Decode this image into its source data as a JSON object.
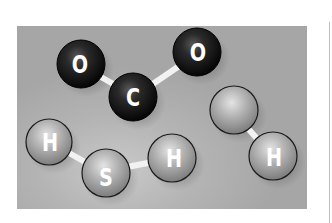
{
  "illustration": {
    "title": "Molecules illustration",
    "panel_color": "#a9a9a9",
    "molecules": [
      {
        "name": "carbon-dioxide",
        "atoms": [
          {
            "label": "O",
            "cx": 81,
            "cy": 64,
            "r": 24,
            "style": "dark"
          },
          {
            "label": "C",
            "cx": 133,
            "cy": 97,
            "r": 24,
            "style": "dark"
          },
          {
            "label": "O",
            "cx": 197,
            "cy": 52,
            "r": 24,
            "style": "dark"
          }
        ],
        "bonds": [
          [
            0,
            1
          ],
          [
            1,
            2
          ]
        ]
      },
      {
        "name": "hydrogen-sulfide",
        "atoms": [
          {
            "label": "H",
            "cx": 49,
            "cy": 142,
            "r": 23,
            "style": "light"
          },
          {
            "label": "S",
            "cx": 106,
            "cy": 173,
            "r": 24,
            "style": "light"
          },
          {
            "label": "H",
            "cx": 172,
            "cy": 158,
            "r": 24,
            "style": "light"
          }
        ],
        "bonds": [
          [
            0,
            1
          ],
          [
            1,
            2
          ]
        ]
      },
      {
        "name": "hydroxyl-pair",
        "atoms": [
          {
            "label": "",
            "cx": 234,
            "cy": 110,
            "r": 24,
            "style": "light"
          },
          {
            "label": "H",
            "cx": 273,
            "cy": 156,
            "r": 24,
            "style": "light"
          }
        ],
        "bonds": [
          [
            0,
            1
          ]
        ]
      }
    ]
  },
  "labels": {
    "o1": "O",
    "c": "C",
    "o2": "O",
    "h1": "H",
    "s": "S",
    "h2": "H",
    "h3": "H"
  }
}
